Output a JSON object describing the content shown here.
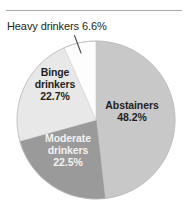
{
  "figure": {
    "name": "drinking-status-pie-chart",
    "rule_present": true
  },
  "chart_data": {
    "type": "pie",
    "title": "",
    "subtitle": "",
    "xlabel": "",
    "ylabel": "",
    "grid": false,
    "legend_position": "none",
    "labels_inside_slices": true,
    "start_angle_deg": 0,
    "direction": "clockwise",
    "units": "percent",
    "categories": [
      "Abstainers",
      "Moderate drinkers",
      "Binge drinkers",
      "Heavy drinkers"
    ],
    "values": [
      48.2,
      22.5,
      22.7,
      6.6
    ],
    "colors": [
      "#c8c8c8",
      "#9a9a9a",
      "#e8e8e8",
      "#fdfdfd"
    ],
    "slices": [
      {
        "name": "Abstainers",
        "value": 48.2,
        "value_text": "48.2%",
        "color": "#c8c8c8",
        "label_color": "#231f20",
        "label_placement": "inside",
        "start_deg": 0,
        "end_deg": 173.5
      },
      {
        "name": "Moderate drinkers",
        "value": 22.5,
        "value_text": "22.5%",
        "color": "#9a9a9a",
        "label_color": "#f2f2f2",
        "label_placement": "inside",
        "start_deg": 173.5,
        "end_deg": 254.5
      },
      {
        "name": "Binge drinkers",
        "value": 22.7,
        "value_text": "22.7%",
        "color": "#e8e8e8",
        "label_color": "#231f20",
        "label_placement": "inside",
        "start_deg": 254.5,
        "end_deg": 336.2
      },
      {
        "name": "Heavy drinkers",
        "value": 6.6,
        "value_text": "6.6%",
        "color": "#fdfdfd",
        "label_color": "#231f20",
        "label_placement": "callout",
        "start_deg": 336.2,
        "end_deg": 360
      }
    ]
  },
  "labels": {
    "heavy_callout": "Heavy drinkers 6.6%",
    "abstainers": {
      "line1": "Abstainers",
      "line2": "48.2%"
    },
    "binge": {
      "line1": "Binge",
      "line2": "drinkers",
      "line3": "22.7%"
    },
    "moderate": {
      "line1": "Moderate",
      "line2": "drinkers",
      "line3": "22.5%"
    }
  },
  "style": {
    "rule_color": "#a9a9a9",
    "pie_outline_color": "#bdbdbd",
    "leader_line_color": "#4a4a4a",
    "background": "#ffffff"
  }
}
